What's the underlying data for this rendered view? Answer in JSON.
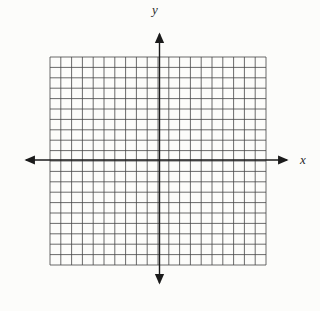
{
  "figure": {
    "x_label": "x",
    "y_label": "y",
    "background_color": "#fcfcfa",
    "grid_color": "#454545",
    "axis_color": "#1b1b1b",
    "label_color": "#2a2a2a",
    "grid": {
      "cols": 20,
      "rows": 20,
      "left": 50,
      "top": 57,
      "right": 266,
      "bottom": 265,
      "line_width": 0.8
    },
    "axes": {
      "y_axis_x": 159.5,
      "x_axis_y": 160,
      "x_arrow_left_tip": 21,
      "x_arrow_right_tip": 292,
      "y_arrow_top_tip": 29,
      "y_arrow_bottom_tip": 288,
      "line_width": 1.4
    },
    "labels": {
      "y_label_x": 155,
      "y_label_y": 14,
      "x_label_x": 300,
      "x_label_y": 164
    }
  },
  "chart_data": {
    "type": "scatter",
    "title": "",
    "xlabel": "x",
    "ylabel": "y",
    "xlim": [
      -10,
      10
    ],
    "ylim": [
      -10,
      10
    ],
    "x_ticks_per_unit": 1,
    "grid": true,
    "grid_squares": "20x20",
    "legend": false,
    "series": [],
    "annotations": []
  }
}
